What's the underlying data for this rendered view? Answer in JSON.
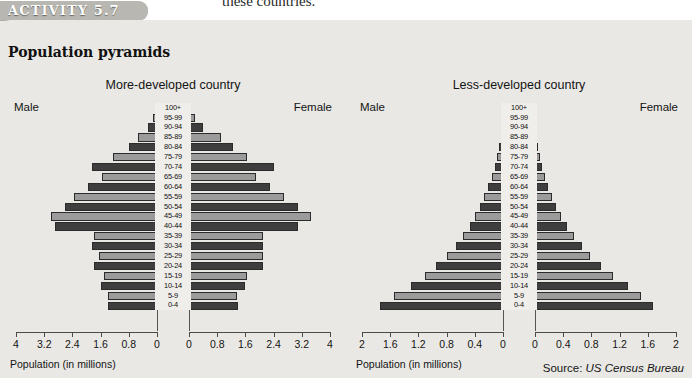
{
  "page": {
    "running_text": "these countries.",
    "badge_label": "ACTIVITY 5.7",
    "panel_title": "Population pyramids",
    "source_prefix": "Source: ",
    "source_name": "US Census Bureau"
  },
  "colors": {
    "page_background": "#e9e8e4",
    "badge_background": "#b9b7b1",
    "bar_dark": "#3e3e3e",
    "bar_light": "#9b9b9b",
    "axis": "#4a4a4a",
    "text": "#141414"
  },
  "charts": {
    "left": {
      "title": "More-developed country",
      "male_label": "Male",
      "female_label": "Female",
      "axis_caption": "Population (in millions)"
    },
    "right": {
      "title": "Less-developed country",
      "male_label": "Male",
      "female_label": "Female",
      "axis_caption": "Population (in millions)"
    }
  },
  "chart_data": [
    {
      "type": "bar",
      "chart_style": "population-pyramid",
      "title": "More-developed country",
      "xlabel": "Population (in millions)",
      "ylabel": "Age group",
      "xlim": [
        0,
        4
      ],
      "tick_values": [
        4,
        3.2,
        2.4,
        1.6,
        0.8,
        0
      ],
      "tick_labels_left": [
        "4",
        "3.2",
        "2.4",
        "1.6",
        "0.8",
        "0"
      ],
      "tick_labels_right": [
        "0",
        "0.8",
        "1.6",
        "2.4",
        "3.2",
        "4"
      ],
      "grid": false,
      "legend": "none",
      "categories": [
        "100+",
        "95-99",
        "90-94",
        "85-89",
        "80-84",
        "75-79",
        "70-74",
        "65-69",
        "60-64",
        "55-59",
        "50-54",
        "45-49",
        "40-44",
        "35-39",
        "30-34",
        "25-29",
        "20-24",
        "15-19",
        "10-14",
        "5-9",
        "0-4"
      ],
      "series": [
        {
          "name": "Male",
          "direction": "left",
          "values": [
            0.02,
            0.1,
            0.25,
            0.55,
            0.8,
            1.25,
            1.85,
            1.55,
            1.95,
            2.35,
            2.6,
            3.0,
            2.9,
            1.8,
            1.85,
            1.65,
            1.8,
            1.5,
            1.6,
            1.4,
            1.4
          ]
        },
        {
          "name": "Female",
          "direction": "right",
          "values": [
            0.05,
            0.18,
            0.4,
            0.9,
            1.25,
            1.65,
            2.4,
            1.9,
            2.3,
            2.7,
            3.1,
            3.45,
            3.1,
            2.1,
            2.1,
            2.1,
            2.1,
            1.65,
            1.6,
            1.35,
            1.4
          ]
        }
      ]
    },
    {
      "type": "bar",
      "chart_style": "population-pyramid",
      "title": "Less-developed country",
      "xlabel": "Population (in millions)",
      "ylabel": "Age group",
      "xlim": [
        0,
        2
      ],
      "tick_values": [
        2,
        1.6,
        1.2,
        0.8,
        0.4,
        0
      ],
      "tick_labels_left": [
        "2",
        "1.6",
        "1.2",
        "0.8",
        "0.4",
        "0"
      ],
      "tick_labels_right": [
        "0",
        "0.4",
        "0.8",
        "1.2",
        "1.6",
        "2"
      ],
      "grid": false,
      "legend": "none",
      "categories": [
        "100+",
        "95-99",
        "90-94",
        "85-89",
        "80-84",
        "75-79",
        "70-74",
        "65-69",
        "60-64",
        "55-59",
        "50-54",
        "45-49",
        "40-44",
        "35-39",
        "30-34",
        "25-29",
        "20-24",
        "15-19",
        "10-14",
        "5-9",
        "0-4"
      ],
      "series": [
        {
          "name": "Male",
          "direction": "left",
          "values": [
            0.0,
            0.005,
            0.01,
            0.02,
            0.05,
            0.08,
            0.12,
            0.16,
            0.21,
            0.27,
            0.33,
            0.4,
            0.47,
            0.57,
            0.67,
            0.8,
            0.95,
            1.1,
            1.3,
            1.55,
            1.75
          ]
        },
        {
          "name": "Female",
          "direction": "right",
          "values": [
            0.0,
            0.005,
            0.01,
            0.02,
            0.04,
            0.07,
            0.1,
            0.14,
            0.18,
            0.24,
            0.3,
            0.37,
            0.45,
            0.55,
            0.66,
            0.78,
            0.93,
            1.1,
            1.32,
            1.5,
            1.68
          ]
        }
      ]
    }
  ]
}
